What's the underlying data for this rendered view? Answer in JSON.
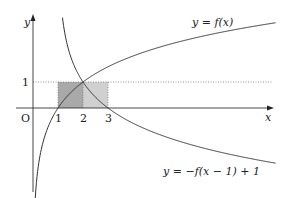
{
  "figure": {
    "axes": {
      "x_label": "x",
      "y_label": "y",
      "origin_label": "O",
      "x_ticks": [
        "1",
        "2",
        "3"
      ],
      "y_ticks": [
        "1"
      ]
    },
    "curves": [
      {
        "label": "y = f(x)",
        "formula": "log2(x)"
      },
      {
        "label": "y = −f(x − 1) + 1",
        "formula": "1 - log2(x-1)"
      }
    ],
    "shaded_regions": [
      {
        "x_from": 1,
        "x_to": 2,
        "y_from": 0,
        "y_to": 1,
        "shade": "#a8a8a8"
      },
      {
        "x_from": 2,
        "x_to": 3,
        "y_from": 0,
        "y_to": 1,
        "shade": "#cfcfcf"
      }
    ],
    "colors": {
      "curve": "#333333",
      "axis": "#333333",
      "dotted": "#777777"
    }
  }
}
